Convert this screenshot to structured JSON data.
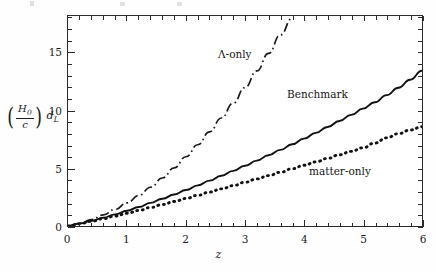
{
  "figure": {
    "background_color": "#ffffff",
    "axis_color": "#2b2b2b"
  },
  "axes": {
    "x": {
      "label": "z",
      "min": 0,
      "max": 6,
      "major_ticks": [
        0,
        1,
        2,
        3,
        4,
        5,
        6
      ],
      "tick_labels": [
        "0",
        "1",
        "2",
        "3",
        "4",
        "5",
        "6"
      ],
      "minor_tick_step": 0.2
    },
    "y": {
      "label_parts": {
        "numerator": "H",
        "numerator_sub": "0",
        "denominator": "c",
        "trailing": "d",
        "trailing_sub": "L"
      },
      "label_text": "(H0/c) dL",
      "min": 0,
      "max": 18.2,
      "major_ticks": [
        0,
        5,
        10,
        15
      ],
      "tick_labels": [
        "0",
        "5",
        "10",
        "15"
      ],
      "minor_tick_step": 1
    }
  },
  "curve_labels": {
    "lambda": "Λ-only",
    "benchmark": "Benchmark",
    "matter": "matter-only"
  },
  "chart_data": {
    "type": "line",
    "title": "",
    "xlabel": "z",
    "ylabel": "(H0/c) dL",
    "xlim": [
      0,
      6
    ],
    "ylim": [
      0,
      18.2
    ],
    "grid": false,
    "legend": "inline-annotations",
    "x": [
      0,
      0.2,
      0.4,
      0.6,
      0.8,
      1.0,
      1.2,
      1.4,
      1.6,
      1.8,
      2.0,
      2.2,
      2.4,
      2.6,
      2.8,
      3.0,
      3.2,
      3.4,
      3.6,
      3.8,
      4.0,
      4.2,
      4.4,
      4.6,
      4.8,
      5.0,
      5.2,
      5.4,
      5.6,
      5.8,
      6.0
    ],
    "series": [
      {
        "name": "Λ-only",
        "style": "dash-dot",
        "color": "#1a1a1a",
        "note": "rises steeply, leaves the top of the frame near z = 3.8",
        "values": [
          0,
          0.24,
          0.56,
          0.96,
          1.44,
          2.0,
          2.64,
          3.36,
          4.16,
          5.04,
          6.0,
          7.04,
          8.16,
          9.36,
          10.64,
          12.0,
          13.44,
          14.96,
          16.56,
          18.0,
          null,
          null,
          null,
          null,
          null,
          null,
          null,
          null,
          null,
          null,
          null
        ]
      },
      {
        "name": "Benchmark",
        "style": "solid",
        "color": "#111111",
        "values": [
          0,
          0.21,
          0.45,
          0.72,
          1.01,
          1.32,
          1.65,
          2.0,
          2.36,
          2.73,
          3.12,
          3.52,
          3.93,
          4.35,
          4.78,
          5.22,
          5.67,
          6.13,
          6.6,
          7.08,
          7.57,
          8.07,
          8.58,
          9.1,
          9.63,
          10.17,
          10.72,
          11.34,
          11.98,
          12.68,
          13.45
        ]
      },
      {
        "name": "matter-only",
        "style": "dotted",
        "color": "#111111",
        "values": [
          0,
          0.2,
          0.41,
          0.63,
          0.86,
          1.1,
          1.35,
          1.6,
          1.86,
          2.12,
          2.39,
          2.66,
          2.94,
          3.22,
          3.5,
          3.79,
          4.08,
          4.37,
          4.66,
          4.96,
          5.26,
          5.56,
          5.86,
          6.17,
          6.47,
          6.78,
          7.19,
          7.64,
          8.0,
          8.32,
          8.6
        ]
      }
    ]
  }
}
